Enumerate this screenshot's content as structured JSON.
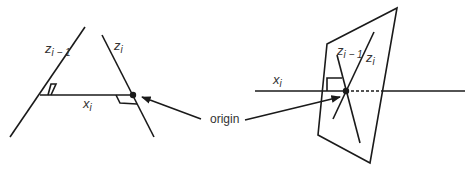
{
  "left_figure": {
    "z_prev_label": "z",
    "z_prev_sub": "i − 1",
    "z_label": "z",
    "z_sub": "i",
    "x_label": "x",
    "x_sub": "i"
  },
  "right_figure": {
    "z_prev_label": "z",
    "z_prev_sub": "i − 1",
    "z_label": "z",
    "z_sub": "i",
    "x_label": "x",
    "x_sub": "i"
  },
  "origin_label": "origin",
  "colors": {
    "line": "#1a1a1a",
    "text": "#333333"
  }
}
